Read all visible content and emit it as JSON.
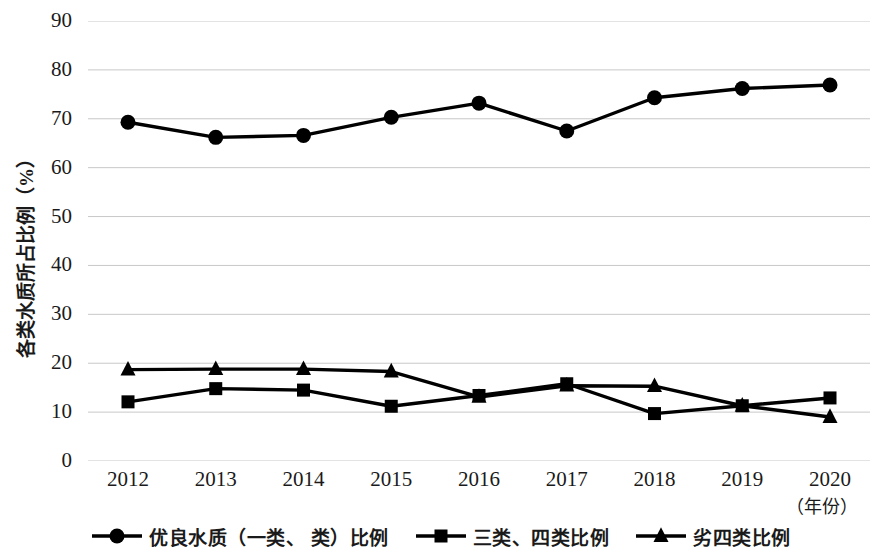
{
  "chart_data": {
    "type": "line",
    "title": "",
    "xlabel": "（年份）",
    "ylabel": "各类水质所占比例（%）",
    "categories": [
      "2012",
      "2013",
      "2014",
      "2015",
      "2016",
      "2017",
      "2018",
      "2019",
      "2020"
    ],
    "ylim": [
      0,
      90
    ],
    "ytick_step": 10,
    "yticks": [
      "90",
      "80",
      "70",
      "60",
      "50",
      "40",
      "30",
      "20",
      "10",
      "0"
    ],
    "grid": "horizontal",
    "legend_position": "bottom",
    "series": [
      {
        "name": "优良水质（一类、 类）比例",
        "marker": "circle",
        "color": "#000000",
        "values": [
          69.3,
          66.2,
          66.6,
          70.3,
          73.2,
          67.5,
          74.3,
          76.2,
          76.9
        ]
      },
      {
        "name": "三类、四类比例",
        "marker": "square",
        "color": "#000000",
        "values": [
          12.1,
          14.8,
          14.5,
          11.2,
          13.4,
          15.8,
          9.7,
          11.3,
          12.9
        ]
      },
      {
        "name": "劣四类比例",
        "marker": "triangle",
        "color": "#000000",
        "values": [
          18.7,
          18.8,
          18.8,
          18.3,
          13.1,
          15.4,
          15.3,
          11.3,
          9.0
        ]
      }
    ]
  },
  "axis": {
    "y_title": "各类水质所占比例（%）",
    "x_unit": "（年份）"
  },
  "legend": {
    "items": [
      {
        "label": "优良水质（一类、 类）比例",
        "marker": "circle"
      },
      {
        "label": "三类、四类比例",
        "marker": "square"
      },
      {
        "label": "劣四类比例",
        "marker": "triangle"
      }
    ]
  }
}
